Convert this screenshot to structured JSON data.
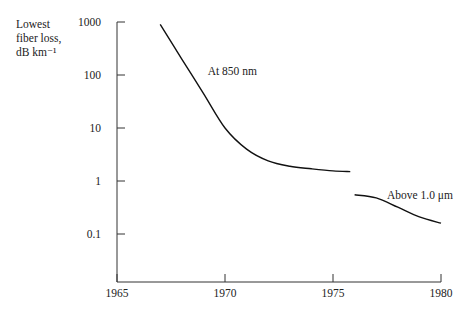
{
  "chart_data": {
    "type": "line",
    "title": "",
    "xlabel": "",
    "ylabel": "Lowest fiber loss, dB km⁻¹",
    "ylabel_lines": [
      "Lowest",
      "fiber loss,",
      "dB km⁻¹"
    ],
    "yscale": "log",
    "xlim": [
      1965,
      1980
    ],
    "ylim": [
      0.01,
      1000
    ],
    "x_ticks": [
      "1965",
      "1970",
      "1975",
      "1980"
    ],
    "y_ticks": [
      "1000",
      "100",
      "10",
      "1",
      "0.1"
    ],
    "grid": false,
    "series": [
      {
        "name": "At 850 nm",
        "x": [
          1967,
          1968,
          1969,
          1970,
          1971,
          1972,
          1973,
          1974,
          1975,
          1975.8
        ],
        "y": [
          900,
          200,
          45,
          10,
          4,
          2.4,
          1.9,
          1.7,
          1.55,
          1.5
        ]
      },
      {
        "name": "Above 1.0 μm",
        "x": [
          1976,
          1977,
          1978,
          1979,
          1980
        ],
        "y": [
          0.55,
          0.48,
          0.32,
          0.21,
          0.16
        ]
      }
    ],
    "annotations": [
      {
        "text": "At 850 nm",
        "x": 1969.2,
        "y": 120
      },
      {
        "text": "Above 1.0 μm",
        "x": 1977.5,
        "y": 0.55
      }
    ]
  }
}
